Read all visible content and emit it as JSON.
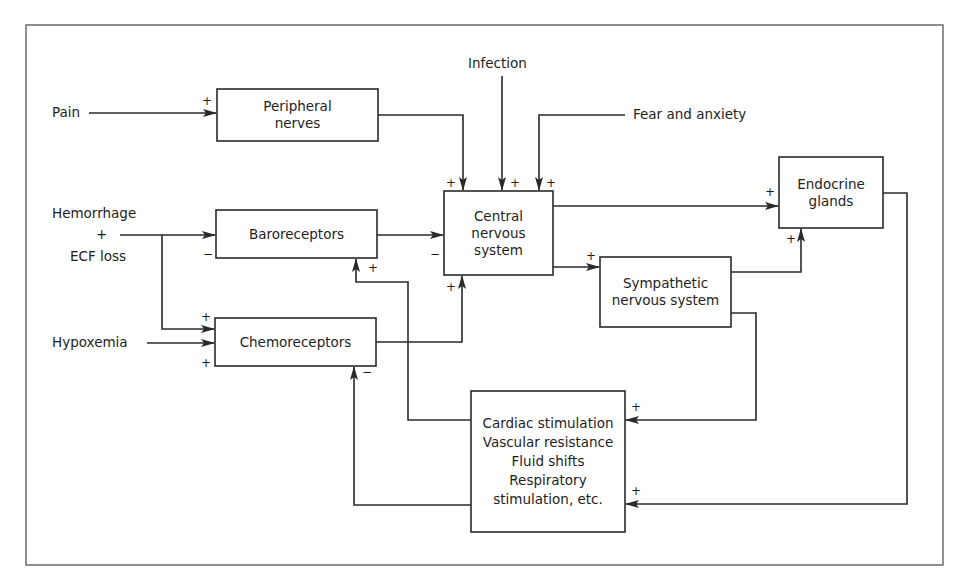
{
  "diagram": {
    "inputs": {
      "pain": "Pain",
      "infection": "Infection",
      "fear": "Fear and anxiety",
      "hemorrhage": "Hemorrhage",
      "hem_plus": "+",
      "ecf": "ECF loss",
      "hypoxemia": "Hypoxemia"
    },
    "boxes": {
      "peripheral": [
        "Peripheral",
        "nerves"
      ],
      "cns": [
        "Central",
        "nervous",
        "system"
      ],
      "endocrine": [
        "Endocrine",
        "glands"
      ],
      "baroreceptors": [
        "Baroreceptors"
      ],
      "chemoreceptors": [
        "Chemoreceptors"
      ],
      "sympathetic": [
        "Sympathetic",
        "nervous system"
      ],
      "effectors": [
        "Cardiac stimulation",
        "Vascular resistance",
        "Fluid shifts",
        "Respiratory",
        "stimulation, etc."
      ]
    },
    "signs": {
      "pain_to_peripheral": "+",
      "peripheral_to_cns": "+",
      "infection_to_cns": "+",
      "fear_to_cns": "+",
      "cns_to_endocrine": "+",
      "hem_to_baro": "−",
      "baro_to_cns": "−",
      "effector_to_baro": "+",
      "cns_to_sympathetic": "+",
      "sympathetic_to_endocrine": "+",
      "hem_to_chemo": "+",
      "hypox_to_chemo": "+",
      "chemo_to_cns": "+",
      "effector_to_chemo": "−",
      "sympathetic_to_effector": "+",
      "endocrine_to_effector": "+"
    },
    "edges": [
      {
        "from": "Pain",
        "to": "Peripheral nerves",
        "sign": "+"
      },
      {
        "from": "Peripheral nerves",
        "to": "Central nervous system",
        "sign": "+"
      },
      {
        "from": "Infection",
        "to": "Central nervous system",
        "sign": "+"
      },
      {
        "from": "Fear and anxiety",
        "to": "Central nervous system",
        "sign": "+"
      },
      {
        "from": "Hemorrhage + ECF loss",
        "to": "Baroreceptors",
        "sign": "−"
      },
      {
        "from": "Hemorrhage + ECF loss",
        "to": "Chemoreceptors",
        "sign": "+"
      },
      {
        "from": "Hypoxemia",
        "to": "Chemoreceptors",
        "sign": "+"
      },
      {
        "from": "Baroreceptors",
        "to": "Central nervous system",
        "sign": "−"
      },
      {
        "from": "Chemoreceptors",
        "to": "Central nervous system",
        "sign": "+"
      },
      {
        "from": "Central nervous system",
        "to": "Endocrine glands",
        "sign": "+"
      },
      {
        "from": "Central nervous system",
        "to": "Sympathetic nervous system",
        "sign": "+"
      },
      {
        "from": "Sympathetic nervous system",
        "to": "Endocrine glands",
        "sign": "+"
      },
      {
        "from": "Sympathetic nervous system",
        "to": "Effectors",
        "sign": "+"
      },
      {
        "from": "Endocrine glands",
        "to": "Effectors",
        "sign": "+"
      },
      {
        "from": "Effectors",
        "to": "Baroreceptors",
        "sign": "+"
      },
      {
        "from": "Effectors",
        "to": "Chemoreceptors",
        "sign": "−"
      }
    ]
  }
}
